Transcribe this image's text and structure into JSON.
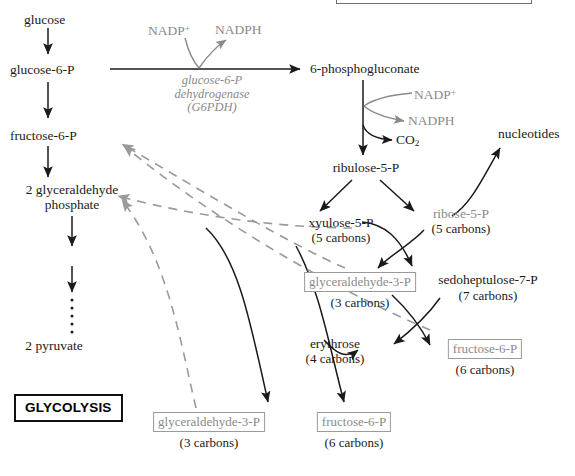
{
  "diagram": {
    "glycolysis_badge": "GLYCOLYSIS",
    "colors": {
      "text": "#1a1a1a",
      "gray_text": "#8a8a8a",
      "solid_arrow": "#1a1a1a",
      "dashed_arrow": "#9a9a9a",
      "box_border_gray": "#9a9a9a",
      "box_border_black": "#111111",
      "background": "#ffffff"
    }
  },
  "glycolysis_column": {
    "nodes": [
      {
        "id": "glucose",
        "label": "glucose"
      },
      {
        "id": "glucose-6-p",
        "label": "glucose-6-P"
      },
      {
        "id": "fructose-6-p",
        "label": "fructose-6-P"
      },
      {
        "id": "glyceraldehyde-phosphate",
        "label_line1": "2 glyceraldehyde",
        "label_line2": "phosphate"
      },
      {
        "id": "pyruvate",
        "label": "2 pyruvate"
      }
    ]
  },
  "enzyme": {
    "line1": "glucose-6-P",
    "line2": "dehydrogenase",
    "line3": "(G6PDH)"
  },
  "cofactors_step1": {
    "substrate": "NADP",
    "substrate_charge": "+",
    "product": "NADPH"
  },
  "cofactors_step2": {
    "substrate": "NADP",
    "substrate_charge": "+",
    "product": "NADPH",
    "co2": "CO",
    "co2_sub": "2"
  },
  "oxidative_branch": {
    "six_phosphogluconate": "6-phosphogluconate",
    "ribulose_5_p": "ribulose-5-P"
  },
  "nucleotides": {
    "label": "nucleotides"
  },
  "metabolites": [
    {
      "id": "xyulose-5-p",
      "label": "xyulose-5-P",
      "carbons": "(5 carbons)",
      "boxed": false,
      "gray": false
    },
    {
      "id": "ribose-5-p",
      "label": "ribose-5-P",
      "carbons": "(5 carbons)",
      "boxed": false,
      "gray": true
    },
    {
      "id": "glyceraldehyde-3-p-mid",
      "label": "glyceraldehyde-3-P",
      "carbons": "(3 carbons)",
      "boxed": true,
      "gray": true
    },
    {
      "id": "sedoheptulose-7-p",
      "label": "sedoheptulose-7-P",
      "carbons": "(7 carbons)",
      "boxed": false,
      "gray": false
    },
    {
      "id": "erythrose",
      "label": "erythrose",
      "carbons": "(4 carbons)",
      "boxed": false,
      "gray": false
    },
    {
      "id": "fructose-6-p-right",
      "label": "fructose-6-P",
      "carbons": "(6 carbons)",
      "boxed": true,
      "gray": true
    },
    {
      "id": "glyceraldehyde-3-p-bottom",
      "label": "glyceraldehyde-3-P",
      "carbons": "(3 carbons)",
      "boxed": true,
      "gray": true
    },
    {
      "id": "fructose-6-p-bottom",
      "label": "fructose-6-P",
      "carbons": "(6 carbons)",
      "boxed": true,
      "gray": true
    }
  ]
}
